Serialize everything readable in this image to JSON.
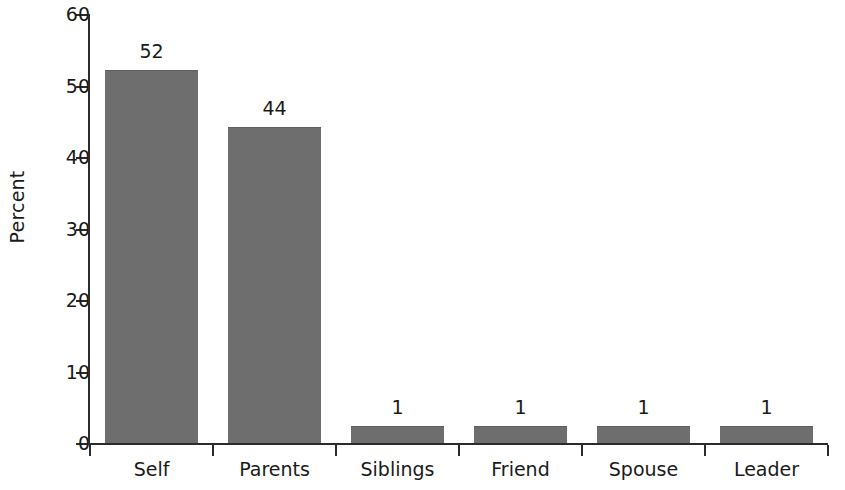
{
  "chart_data": {
    "type": "bar",
    "title": "",
    "xlabel": "",
    "ylabel": "Percent",
    "categories": [
      "Self",
      "Parents",
      "Siblings",
      "Friend",
      "Spouse",
      "Leader"
    ],
    "values": [
      52,
      44,
      1,
      1,
      1,
      1
    ],
    "value_labels": [
      "52",
      "44",
      "1",
      "1",
      "1",
      "1"
    ],
    "ylim": [
      0,
      60
    ],
    "yticks": [
      0,
      10,
      20,
      30,
      40,
      50,
      60
    ],
    "ytick_labels": [
      "0",
      "10",
      "20",
      "30",
      "40",
      "50",
      "60"
    ],
    "grid": false,
    "legend": false,
    "legend_position": "none",
    "bar_color": "#6e6e6e",
    "axis_color": "#2b2b2b",
    "text_color": "#1a1a1a",
    "background_color": "#ffffff"
  }
}
